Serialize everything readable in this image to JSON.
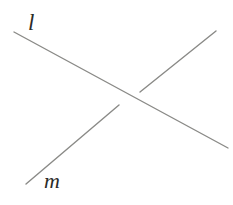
{
  "figure": {
    "background_color": "#ffffff",
    "width": 233,
    "height": 205,
    "stroke_color": "#8a8a87",
    "label_color": "#2b2b28",
    "labels": [
      {
        "id": "label-l",
        "text": "l",
        "x": 28,
        "y": 11
      },
      {
        "id": "label-m",
        "text": "m",
        "x": 44,
        "y": 170
      }
    ],
    "lines": [
      {
        "id": "line-l",
        "name": "l",
        "x1": 14,
        "y1": 32,
        "x2": 228,
        "y2": 148,
        "stroke_width": 1.4,
        "broken": false
      },
      {
        "id": "line-m",
        "name": "m",
        "x1": 26,
        "y1": 184,
        "x2": 216,
        "y2": 31,
        "stroke_width": 1.4,
        "broken": true,
        "gap_start": {
          "x": 119,
          "y": 105
        },
        "gap_end": {
          "x": 140,
          "y": 92
        }
      }
    ],
    "intersection": {
      "x": 130,
      "y": 99
    }
  }
}
